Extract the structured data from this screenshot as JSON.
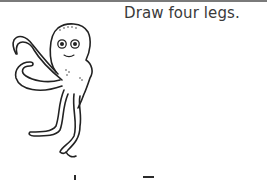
{
  "worksheet": {
    "instruction": "Draw four legs.",
    "illustration": {
      "subject": "octopus",
      "style": "black outline line art",
      "visible_legs": 4
    },
    "colors": {
      "rule": "#7a7a7a",
      "text": "#3a3a3a",
      "ink": "#222222",
      "background": "#ffffff"
    }
  }
}
